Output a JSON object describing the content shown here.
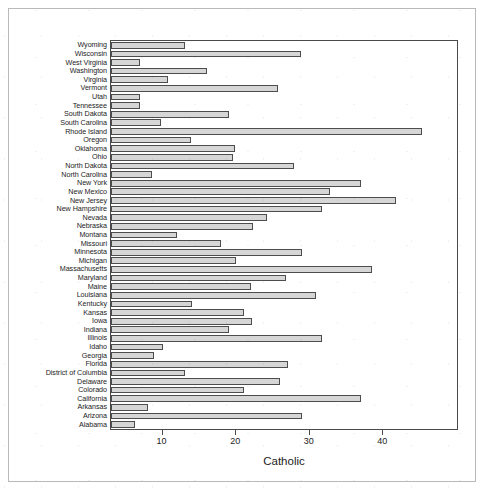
{
  "chart_data": {
    "type": "bar",
    "orientation": "horizontal",
    "title": "",
    "xlabel": "Catholic",
    "ylabel": "",
    "xlim": [
      3,
      50
    ],
    "xticks": [
      10,
      20,
      30,
      40
    ],
    "xticklabels": [
      "10",
      "20",
      "30",
      "40"
    ],
    "grid": false,
    "legend": null,
    "bar_fill_color": "#d6d6d6",
    "bar_border_color": "#4d4d4d",
    "axis_color": "#4a4a4a",
    "categories": [
      "Wyoming",
      "Wisconsin",
      "West Virginia",
      "Washington",
      "Virginia",
      "Vermont",
      "Utah",
      "Tennessee",
      "South Dakota",
      "South Carolina",
      "Rhode Island",
      "Oregon",
      "Oklahoma",
      "Ohio",
      "North Dakota",
      "North Carolina",
      "New York",
      "New Mexico",
      "New Jersey",
      "New Hampshire",
      "Nevada",
      "Nebraska",
      "Montana",
      "Missouri",
      "Minnesota",
      "Michigan",
      "Massachusetts",
      "Maryland",
      "Maine",
      "Louisiana",
      "Kentucky",
      "Kansas",
      "Iowa",
      "Indiana",
      "Illinois",
      "Idaho",
      "Georgia",
      "Florida",
      "District of Columbia",
      "Delaware",
      "Colorado",
      "California",
      "Arkansas",
      "Arizona",
      "Alabama"
    ],
    "values": [
      13.0,
      28.8,
      6.9,
      16.0,
      10.8,
      25.7,
      7.0,
      7.0,
      19.0,
      9.8,
      45.3,
      13.8,
      19.8,
      19.6,
      27.8,
      8.6,
      36.9,
      32.8,
      41.7,
      31.6,
      24.2,
      22.3,
      12.0,
      18.0,
      29.0,
      20.0,
      38.5,
      26.8,
      22.0,
      30.8,
      14.0,
      21.0,
      22.2,
      19.0,
      31.6,
      10.0,
      8.8,
      27.0,
      13.0,
      26.0,
      21.0,
      36.9,
      8.0,
      28.9,
      6.2
    ]
  },
  "axis": {
    "xlabel": "Catholic"
  }
}
